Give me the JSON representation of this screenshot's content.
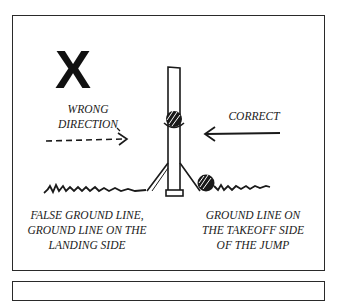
{
  "diagram": {
    "wrong_mark": "X",
    "wrong_label_line1": "WRONG",
    "wrong_label_line2": "DIRECTION",
    "correct_label": "CORRECT",
    "left_caption_line1": "FALSE GROUND LINE,",
    "left_caption_line2": "GROUND LINE ON THE",
    "left_caption_line3": "LANDING SIDE",
    "right_caption_line1": "GROUND LINE ON",
    "right_caption_line2": "THE TAKEOFF SIDE",
    "right_caption_line3": "OF THE JUMP",
    "colors": {
      "ink": "#1a1a1a",
      "background": "#ffffff"
    }
  }
}
